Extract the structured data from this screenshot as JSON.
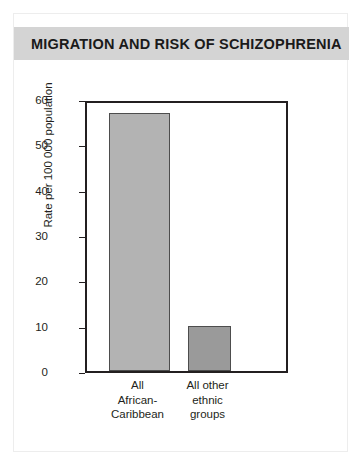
{
  "title": "MIGRATION AND RISK OF SCHIZOPHRENIA",
  "colors": {
    "title_band": "#d4d4d4",
    "bar_1": "#b3b3b3",
    "bar_2": "#9a9a9a",
    "axis": "#231f20"
  },
  "chart_data": {
    "type": "bar",
    "title": "MIGRATION AND RISK OF SCHIZOPHRENIA",
    "categories": [
      "All African-Caribbean",
      "All other ethnic groups"
    ],
    "category_lines": [
      [
        "All",
        "African-",
        "Caribbean"
      ],
      [
        "All other",
        "ethnic",
        "groups"
      ]
    ],
    "values": [
      57,
      10
    ],
    "xlabel": "",
    "ylabel": "Rate per 100 000 population",
    "ylim": [
      0,
      60
    ],
    "yticks": [
      0,
      10,
      20,
      30,
      40,
      50,
      60
    ],
    "ytick_labels": [
      "0",
      "10",
      "20",
      "30",
      "40",
      "50",
      "60"
    ],
    "grid": false,
    "legend": false,
    "bar_colors": [
      "#b3b3b3",
      "#9a9a9a"
    ]
  }
}
